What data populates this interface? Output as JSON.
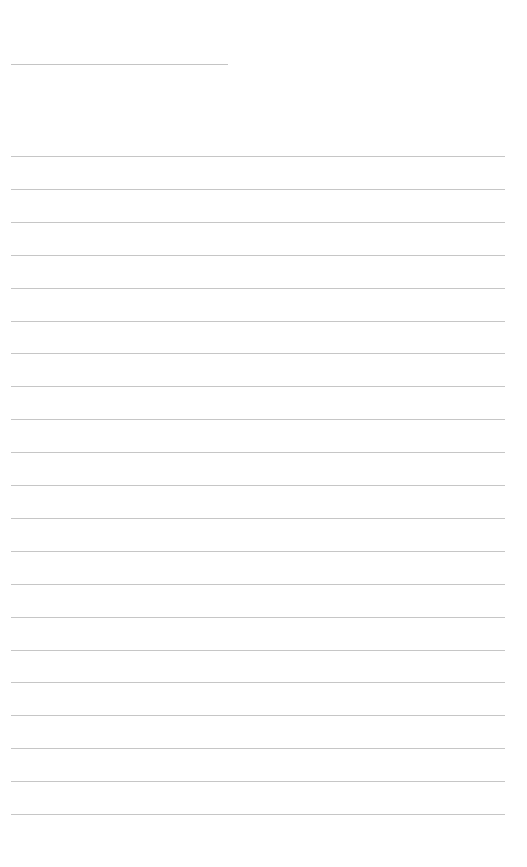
{
  "document": {
    "type": "blank ruled sheet",
    "header_line": {
      "x": 11,
      "y": 64,
      "width": 217,
      "color": "#c4c4c4"
    },
    "ruled_lines": {
      "count": 21,
      "start_y": 156,
      "spacing": 32.9,
      "x": 11,
      "width": 494,
      "color": "#c6c6c6"
    },
    "text_content": []
  }
}
